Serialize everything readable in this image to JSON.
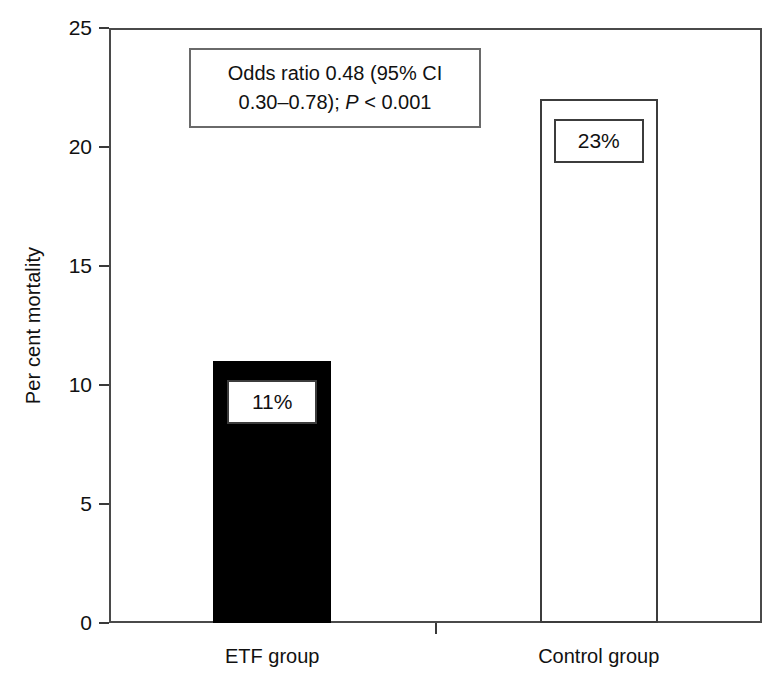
{
  "chart_data": {
    "type": "bar",
    "title": "",
    "xlabel": "",
    "ylabel": "Per cent mortality",
    "categories": [
      "ETF group",
      "Control group"
    ],
    "values": [
      11,
      22
    ],
    "data_labels": [
      "11%",
      "23%"
    ],
    "ylim": [
      0,
      25
    ],
    "yticks": [
      0,
      5,
      10,
      15,
      20,
      25
    ],
    "ytick_labels": [
      "0",
      "5",
      "10",
      "15",
      "20",
      "25"
    ],
    "grid": false,
    "legend": "none",
    "bar_styles": [
      {
        "name": "ETF group",
        "fill": "#000000",
        "edge": "#000000",
        "filled": true
      },
      {
        "name": "Control group",
        "fill": "#ffffff",
        "edge": "#3c3c3c",
        "filled": false
      }
    ],
    "annotations": [
      {
        "name": "odds-ratio-note",
        "line1": "Odds ratio 0.48 (95% CI",
        "line2_pre": "0.30–0.78); ",
        "line2_italic": "P",
        "line2_post": " < 0.001"
      }
    ]
  },
  "colors": {
    "axis": "#4a4a4a",
    "tick": "#3a3a3a",
    "text": "#111111",
    "bar_filled": "#000000",
    "bar_hollow_edge": "#3c3c3c",
    "background": "#ffffff"
  }
}
